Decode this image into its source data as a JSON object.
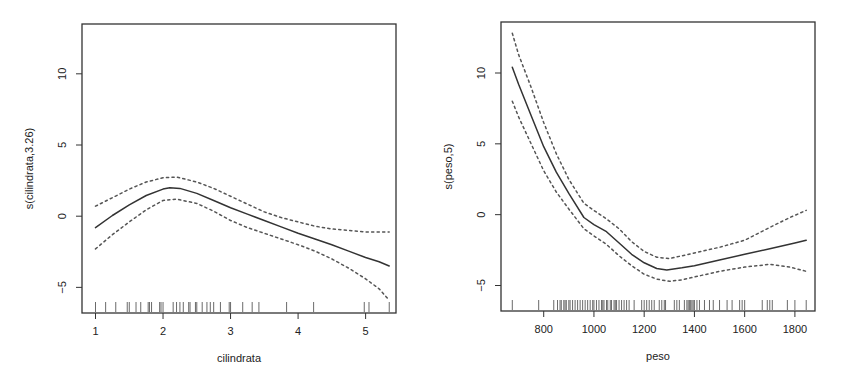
{
  "chart_data": [
    {
      "type": "line",
      "title": "",
      "xlabel": "cilindrata",
      "ylabel": "s(cilindrata,3.26)",
      "xlim": [
        0.8,
        5.45
      ],
      "ylim": [
        -6.8,
        13.5
      ],
      "xticks": [
        1,
        2,
        3,
        4,
        5
      ],
      "xtick_labels": [
        "1",
        "2",
        "3",
        "4",
        "5"
      ],
      "yticks": [
        -5,
        0,
        5,
        10
      ],
      "ytick_labels": [
        "-5",
        "0",
        "5",
        "10"
      ],
      "grid": false,
      "legend": null,
      "series": [
        {
          "name": "smooth fit",
          "style": "solid",
          "x": [
            1.0,
            1.25,
            1.5,
            1.75,
            2.0,
            2.1,
            2.25,
            2.5,
            2.75,
            3.0,
            3.25,
            3.5,
            3.75,
            4.0,
            4.25,
            4.5,
            4.75,
            5.0,
            5.2,
            5.35
          ],
          "y": [
            -0.8,
            0.05,
            0.8,
            1.45,
            1.9,
            2.0,
            1.95,
            1.6,
            1.1,
            0.6,
            0.15,
            -0.3,
            -0.75,
            -1.2,
            -1.6,
            -2.0,
            -2.45,
            -2.9,
            -3.2,
            -3.5
          ]
        },
        {
          "name": "upper 2se",
          "style": "dashed",
          "x": [
            1.0,
            1.25,
            1.5,
            1.75,
            2.0,
            2.2,
            2.5,
            2.75,
            3.0,
            3.25,
            3.5,
            3.75,
            4.0,
            4.25,
            4.5,
            4.75,
            5.0,
            5.2,
            5.35
          ],
          "y": [
            0.7,
            1.3,
            1.9,
            2.4,
            2.7,
            2.75,
            2.4,
            1.95,
            1.4,
            0.85,
            0.3,
            -0.1,
            -0.4,
            -0.7,
            -0.9,
            -1.0,
            -1.1,
            -1.1,
            -1.1
          ]
        },
        {
          "name": "lower 2se",
          "style": "dashed",
          "x": [
            1.0,
            1.25,
            1.5,
            1.75,
            2.0,
            2.2,
            2.5,
            2.75,
            3.0,
            3.25,
            3.5,
            3.75,
            4.0,
            4.25,
            4.5,
            4.75,
            5.0,
            5.2,
            5.35
          ],
          "y": [
            -2.3,
            -1.3,
            -0.4,
            0.45,
            1.1,
            1.2,
            0.9,
            0.35,
            -0.3,
            -0.8,
            -1.2,
            -1.6,
            -2.0,
            -2.45,
            -3.0,
            -3.65,
            -4.4,
            -5.1,
            -5.9
          ]
        }
      ],
      "rug": [
        1.0,
        1.15,
        1.3,
        1.47,
        1.5,
        1.6,
        1.67,
        1.78,
        1.8,
        1.83,
        1.95,
        1.97,
        2.0,
        2.15,
        2.2,
        2.25,
        2.3,
        2.38,
        2.4,
        2.48,
        2.5,
        2.58,
        2.65,
        2.7,
        2.75,
        2.85,
        2.98,
        3.0,
        3.18,
        3.32,
        3.42,
        3.83,
        4.23,
        4.98,
        5.05,
        5.35
      ]
    },
    {
      "type": "line",
      "title": "",
      "xlabel": "peso",
      "ylabel": "s(peso,5)",
      "xlim": [
        630,
        1880
      ],
      "ylim": [
        -6.8,
        13.6
      ],
      "xticks": [
        800,
        1000,
        1200,
        1400,
        1600,
        1800
      ],
      "xtick_labels": [
        "800",
        "1000",
        "1200",
        "1400",
        "1600",
        "1800"
      ],
      "yticks": [
        -5,
        0,
        5,
        10
      ],
      "ytick_labels": [
        "-5",
        "0",
        "5",
        "10"
      ],
      "grid": false,
      "legend": null,
      "series": [
        {
          "name": "smooth fit",
          "style": "solid",
          "x": [
            675,
            700,
            750,
            800,
            850,
            900,
            960,
            1000,
            1050,
            1100,
            1150,
            1200,
            1250,
            1290,
            1350,
            1400,
            1500,
            1600,
            1700,
            1800,
            1845
          ],
          "y": [
            10.4,
            9.2,
            7.0,
            4.8,
            3.0,
            1.5,
            -0.2,
            -0.7,
            -1.2,
            -2.0,
            -2.8,
            -3.4,
            -3.8,
            -3.9,
            -3.75,
            -3.6,
            -3.2,
            -2.8,
            -2.4,
            -2.0,
            -1.8
          ]
        },
        {
          "name": "upper 2se",
          "style": "dashed",
          "x": [
            675,
            700,
            750,
            800,
            850,
            900,
            960,
            1000,
            1050,
            1100,
            1150,
            1200,
            1250,
            1300,
            1350,
            1400,
            1500,
            1600,
            1700,
            1780,
            1845
          ],
          "y": [
            12.8,
            11.3,
            9.0,
            6.5,
            4.3,
            2.5,
            0.8,
            0.3,
            -0.3,
            -1.0,
            -1.9,
            -2.6,
            -3.0,
            -3.1,
            -2.9,
            -2.7,
            -2.3,
            -1.8,
            -0.9,
            -0.2,
            0.3
          ]
        },
        {
          "name": "lower 2se",
          "style": "dashed",
          "x": [
            675,
            700,
            750,
            800,
            850,
            900,
            960,
            1000,
            1050,
            1100,
            1150,
            1200,
            1250,
            1300,
            1350,
            1400,
            1500,
            1600,
            1700,
            1780,
            1845
          ],
          "y": [
            8.0,
            6.9,
            5.0,
            3.1,
            1.6,
            0.4,
            -1.0,
            -1.5,
            -2.1,
            -2.9,
            -3.6,
            -4.2,
            -4.55,
            -4.7,
            -4.6,
            -4.4,
            -4.0,
            -3.7,
            -3.5,
            -3.7,
            -4.0
          ]
        }
      ],
      "rug": [
        675,
        780,
        840,
        855,
        865,
        870,
        880,
        885,
        890,
        900,
        905,
        915,
        925,
        935,
        945,
        955,
        965,
        975,
        985,
        995,
        1000,
        1010,
        1020,
        1030,
        1035,
        1040,
        1050,
        1055,
        1065,
        1070,
        1080,
        1085,
        1090,
        1100,
        1110,
        1120,
        1130,
        1140,
        1160,
        1190,
        1200,
        1210,
        1220,
        1230,
        1240,
        1260,
        1270,
        1280,
        1285,
        1320,
        1330,
        1340,
        1360,
        1370,
        1375,
        1380,
        1385,
        1390,
        1395,
        1400,
        1410,
        1420,
        1440,
        1460,
        1475,
        1500,
        1530,
        1550,
        1580,
        1590,
        1600,
        1670,
        1690,
        1700,
        1710,
        1770,
        1800,
        1845
      ]
    }
  ]
}
